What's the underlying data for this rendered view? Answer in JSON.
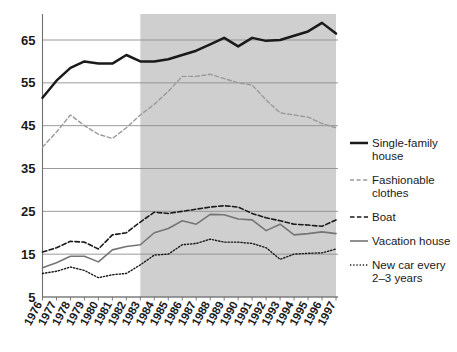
{
  "chart_data": {
    "type": "line",
    "title": "",
    "subtitle": "",
    "xlabel": "",
    "ylabel": "",
    "x": [
      1976,
      1977,
      1978,
      1979,
      1980,
      1981,
      1982,
      1983,
      1984,
      1985,
      1986,
      1987,
      1988,
      1989,
      1990,
      1991,
      1992,
      1993,
      1994,
      1995,
      1996,
      1997
    ],
    "xtick_labels": [
      "1976",
      "1977",
      "1978",
      "1979",
      "1980",
      "1981",
      "1982",
      "1983",
      "1984",
      "1985",
      "1986",
      "1987",
      "1988",
      "1989",
      "1990",
      "1991",
      "1992",
      "1993",
      "1994",
      "1995",
      "1996",
      "1997"
    ],
    "ytick_labels": [
      "5",
      "15",
      "25",
      "35",
      "45",
      "55",
      "65"
    ],
    "ytick_values": [
      5,
      15,
      25,
      35,
      45,
      55,
      65
    ],
    "ylim": [
      3,
      71
    ],
    "xlim": [
      1976,
      1997
    ],
    "grid": "horizontal",
    "legend_position": "right",
    "shaded_region": {
      "x_start": 1983,
      "x_end": 1997,
      "color": "#cfcfcf",
      "label": ""
    },
    "series": [
      {
        "name": "Single-family house",
        "style": "solid-thick",
        "color": "#1a1a1a",
        "values": [
          51.5,
          55.5,
          58.5,
          60.0,
          59.5,
          59.5,
          61.5,
          60.0,
          60.0,
          60.5,
          61.5,
          62.5,
          64.0,
          65.5,
          63.5,
          65.5,
          64.8,
          65.0,
          66.0,
          67.0,
          69.0,
          66.5
        ]
      },
      {
        "name": "Fashionable clothes",
        "style": "dashed-light",
        "color": "#9a9a9a",
        "values": [
          40.0,
          43.5,
          47.5,
          45.0,
          43.0,
          42.0,
          44.5,
          47.5,
          50.0,
          53.0,
          56.5,
          56.5,
          57.0,
          56.0,
          55.0,
          54.5,
          51.0,
          48.0,
          47.5,
          47.0,
          45.5,
          44.5
        ]
      },
      {
        "name": "Boat",
        "style": "dashed-dark",
        "color": "#1a1a1a",
        "values": [
          15.5,
          16.5,
          18.0,
          17.8,
          16.2,
          19.5,
          20.0,
          22.5,
          24.8,
          24.5,
          25.0,
          25.5,
          26.0,
          26.3,
          26.0,
          24.5,
          23.5,
          22.8,
          22.0,
          21.8,
          21.5,
          23.0
        ]
      },
      {
        "name": "Vacation house",
        "style": "solid-gray",
        "color": "#757575",
        "values": [
          11.8,
          13.0,
          14.5,
          14.5,
          13.2,
          16.0,
          16.8,
          17.2,
          20.0,
          21.0,
          22.8,
          22.0,
          24.3,
          24.2,
          23.2,
          23.0,
          20.5,
          22.0,
          19.5,
          19.8,
          20.2,
          19.8
        ]
      },
      {
        "name": "New car every 2–3 years",
        "style": "dotted",
        "color": "#1a1a1a",
        "values": [
          10.5,
          11.0,
          12.0,
          11.2,
          9.5,
          10.2,
          10.5,
          12.5,
          14.8,
          15.0,
          17.2,
          17.5,
          18.5,
          17.8,
          17.8,
          17.5,
          16.5,
          13.8,
          15.0,
          15.2,
          15.3,
          16.2
        ]
      }
    ],
    "legend": [
      {
        "label_line1": "Single-family",
        "label_line2": "house",
        "style": "solid-thick"
      },
      {
        "label_line1": "Fashionable",
        "label_line2": "clothes",
        "style": "dashed-light"
      },
      {
        "label_line1": "Boat",
        "label_line2": "",
        "style": "dashed-dark"
      },
      {
        "label_line1": "Vacation house",
        "label_line2": "",
        "style": "solid-gray"
      },
      {
        "label_line1": "New car every",
        "label_line2": "2–3 years",
        "style": "dotted"
      }
    ]
  },
  "colors": {
    "background": "#ffffff",
    "shade": "#cfcfcf",
    "grid": "#8e8e8e",
    "axis": "#6f6f6f",
    "ink": "#1a1a1a",
    "light_line": "#9a9a9a",
    "mid_line": "#757575"
  }
}
